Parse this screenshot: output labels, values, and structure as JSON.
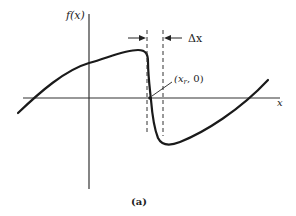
{
  "figure": {
    "caption": "(a)",
    "y_axis_label": "f(x)",
    "x_axis_label": "x",
    "root_label": "(x",
    "root_label_sub": "r",
    "root_label_tail": ", 0)",
    "interval_label": "Δx",
    "colors": {
      "ink": "#1a1a1a",
      "axis": "#333333",
      "background": "#ffffff"
    }
  },
  "elements": {
    "curve": "f(x) with steep descent crossing x-axis at root",
    "dashed_lines": 2,
    "arrows": [
      "right-pointing arrow to left bracket line",
      "left-pointing arrow to right bracket line"
    ]
  }
}
